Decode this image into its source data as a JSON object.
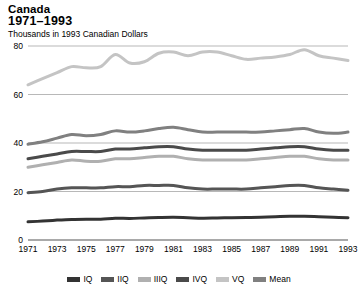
{
  "header": {
    "title_country": "Canada",
    "title_years": "1971–1993",
    "subtitle": "Thousands in 1993 Canadian Dollars"
  },
  "legend": {
    "items": [
      {
        "label": "IQ",
        "color": "#333333"
      },
      {
        "label": "IIQ",
        "color": "#555555"
      },
      {
        "label": "IIIQ",
        "color": "#b0b0b0"
      },
      {
        "label": "IVQ",
        "color": "#4a4a4a"
      },
      {
        "label": "VQ",
        "color": "#c4c4c4"
      },
      {
        "label": "Mean",
        "color": "#808080"
      }
    ]
  },
  "chart_data": {
    "type": "line",
    "title": "Canada 1971–1993",
    "subtitle": "Thousands in 1993 Canadian Dollars",
    "xlabel": "",
    "ylabel": "",
    "ylim": [
      0,
      80
    ],
    "yticks": [
      0,
      20,
      40,
      60,
      80
    ],
    "ytick_labels": [
      "0",
      "20",
      "40",
      "60",
      "80"
    ],
    "grid": true,
    "legend_position": "bottom",
    "x": [
      1971,
      1972,
      1973,
      1974,
      1975,
      1976,
      1977,
      1978,
      1979,
      1980,
      1981,
      1982,
      1983,
      1984,
      1985,
      1986,
      1987,
      1988,
      1989,
      1990,
      1991,
      1992,
      1993
    ],
    "xticks": [
      1971,
      1973,
      1975,
      1977,
      1979,
      1981,
      1983,
      1985,
      1987,
      1989,
      1991,
      1993
    ],
    "xtick_labels": [
      "1971",
      "1973",
      "1975",
      "1977",
      "1979",
      "1981",
      "1983",
      "1985",
      "1987",
      "1989",
      "1991",
      "1993"
    ],
    "series": [
      {
        "name": "VQ",
        "color": "#c4c4c4",
        "values": [
          64.0,
          66.5,
          69.0,
          71.5,
          71.0,
          71.5,
          76.5,
          73.0,
          73.5,
          77.0,
          77.5,
          76.0,
          77.5,
          77.5,
          76.0,
          74.5,
          75.0,
          75.5,
          76.5,
          78.5,
          76.0,
          75.0,
          74.0
        ]
      },
      {
        "name": "Mean",
        "color": "#808080",
        "values": [
          39.5,
          40.5,
          42.0,
          43.5,
          43.0,
          43.5,
          45.0,
          44.5,
          45.0,
          46.0,
          46.5,
          45.5,
          44.5,
          44.5,
          44.5,
          44.5,
          44.5,
          45.0,
          45.5,
          46.0,
          44.5,
          44.0,
          44.5
        ]
      },
      {
        "name": "IVQ",
        "color": "#4a4a4a",
        "values": [
          33.5,
          34.5,
          35.5,
          36.5,
          36.5,
          36.5,
          37.5,
          37.5,
          38.0,
          38.5,
          38.5,
          37.5,
          37.0,
          37.0,
          37.0,
          37.0,
          37.5,
          38.0,
          38.5,
          38.5,
          37.5,
          37.0,
          37.0
        ]
      },
      {
        "name": "IIIQ",
        "color": "#b0b0b0",
        "values": [
          30.0,
          31.0,
          32.0,
          33.0,
          32.5,
          32.5,
          33.5,
          33.5,
          34.0,
          34.5,
          34.5,
          33.5,
          33.0,
          33.0,
          33.0,
          33.0,
          33.5,
          34.0,
          34.5,
          34.5,
          33.5,
          33.0,
          33.0
        ]
      },
      {
        "name": "IIQ",
        "color": "#555555",
        "values": [
          19.5,
          20.0,
          21.0,
          21.5,
          21.5,
          21.5,
          22.0,
          22.0,
          22.5,
          22.5,
          22.5,
          21.5,
          21.0,
          21.0,
          21.0,
          21.0,
          21.5,
          22.0,
          22.5,
          22.5,
          21.5,
          21.0,
          20.5
        ]
      },
      {
        "name": "IQ",
        "color": "#333333",
        "values": [
          7.5,
          7.8,
          8.2,
          8.5,
          8.6,
          8.6,
          9.0,
          8.9,
          9.1,
          9.3,
          9.4,
          9.2,
          9.0,
          9.1,
          9.2,
          9.3,
          9.4,
          9.6,
          9.8,
          9.8,
          9.6,
          9.4,
          9.2
        ]
      }
    ]
  }
}
